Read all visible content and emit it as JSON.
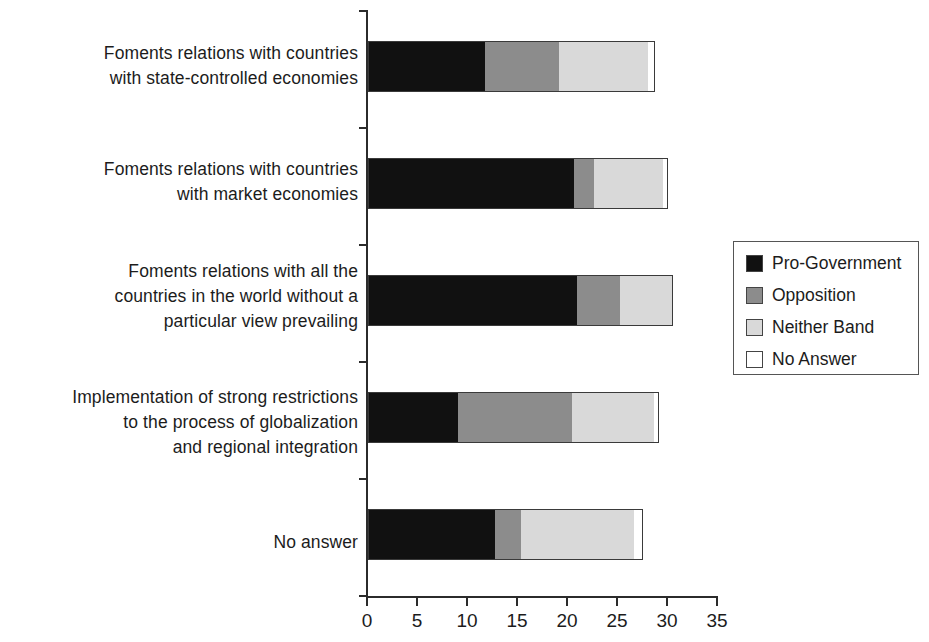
{
  "chart": {
    "type": "bar",
    "title": "",
    "xlabel": "",
    "ylabel": ""
  },
  "axis": {
    "x_ticks": [
      "0",
      "5",
      "10",
      "15",
      "20",
      "25",
      "30",
      "35"
    ],
    "x_min": 0,
    "x_max": 35
  },
  "legend": {
    "items": [
      {
        "label": "Pro-Government",
        "color": "#111111",
        "key": "pro"
      },
      {
        "label": "Opposition",
        "color": "#8c8c8c",
        "key": "opp"
      },
      {
        "label": "Neither Band",
        "color": "#d9d9d9",
        "key": "nei"
      },
      {
        "label": "No Answer",
        "color": "#ffffff",
        "key": "noa"
      }
    ]
  },
  "chart_data": {
    "type": "bar",
    "orientation": "horizontal",
    "stacked": true,
    "title": "",
    "xlabel": "",
    "ylabel": "",
    "xlim": [
      0,
      35
    ],
    "xticks": [
      0,
      5,
      10,
      15,
      20,
      25,
      30,
      35
    ],
    "grid": false,
    "legend_position": "right",
    "categories": [
      "Foments relations with countries\nwith state-controlled economies",
      "Foments relations with countries\nwith market economies",
      "Foments relations with all the\ncountries in the world without a\nparticular view prevailing",
      "Implementation of strong restrictions\nto the process of globalization\nand regional integration",
      "No answer"
    ],
    "series": [
      {
        "name": "Pro-Government",
        "color": "#111111",
        "values": [
          11.7,
          20.6,
          20.9,
          9.0,
          12.7
        ]
      },
      {
        "name": "Opposition",
        "color": "#8c8c8c",
        "values": [
          7.4,
          2.0,
          4.3,
          11.4,
          2.6
        ]
      },
      {
        "name": "Neither Band",
        "color": "#d9d9d9",
        "values": [
          8.9,
          6.9,
          5.3,
          8.2,
          11.3
        ]
      },
      {
        "name": "No Answer",
        "color": "#ffffff",
        "values": [
          0.7,
          0.5,
          0.0,
          0.5,
          0.9
        ]
      }
    ],
    "totals": [
      28.7,
      30.0,
      30.5,
      29.1,
      27.5
    ]
  }
}
